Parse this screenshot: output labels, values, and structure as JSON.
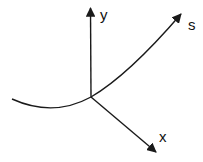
{
  "diagram": {
    "type": "coordinate-axes-with-curve",
    "stroke_color": "#1a1a1a",
    "background": "#ffffff",
    "labels": {
      "y_axis": "y",
      "x_axis": "x",
      "curve": "s"
    },
    "elements": [
      {
        "id": "y-axis",
        "kind": "arrow",
        "from": [
          91,
          97
        ],
        "to": [
          90,
          7
        ]
      },
      {
        "id": "x-axis",
        "kind": "arrow",
        "from": [
          91,
          97
        ],
        "to": [
          157,
          153
        ]
      },
      {
        "id": "s-curve",
        "kind": "curved-arrow",
        "from": [
          12,
          99
        ],
        "through": [
          91,
          97
        ],
        "to": [
          182,
          13
        ]
      }
    ]
  }
}
